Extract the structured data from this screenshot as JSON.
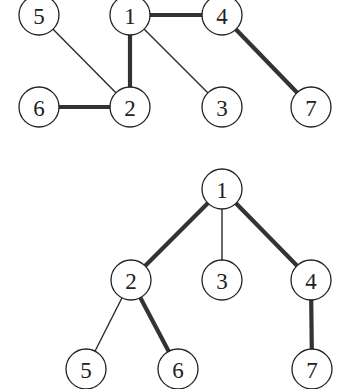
{
  "graphs": [
    {
      "name": "graph",
      "nodes": [
        {
          "id": "1",
          "label": "1",
          "x": 130,
          "y": 15
        },
        {
          "id": "4",
          "label": "4",
          "x": 222,
          "y": 15
        },
        {
          "id": "5",
          "label": "5",
          "x": 39,
          "y": 15
        },
        {
          "id": "6",
          "label": "6",
          "x": 39,
          "y": 107
        },
        {
          "id": "2",
          "label": "2",
          "x": 130,
          "y": 107
        },
        {
          "id": "3",
          "label": "3",
          "x": 222,
          "y": 107
        },
        {
          "id": "7",
          "label": "7",
          "x": 311,
          "y": 107
        }
      ],
      "edges": [
        {
          "from": "1",
          "to": "4",
          "weight": "thick"
        },
        {
          "from": "1",
          "to": "2",
          "weight": "thick"
        },
        {
          "from": "1",
          "to": "3",
          "weight": "thin"
        },
        {
          "from": "5",
          "to": "2",
          "weight": "thin"
        },
        {
          "from": "6",
          "to": "2",
          "weight": "thick"
        },
        {
          "from": "4",
          "to": "7",
          "weight": "thick"
        }
      ]
    },
    {
      "name": "spanning-tree",
      "nodes": [
        {
          "id": "1",
          "label": "1",
          "x": 222,
          "y": 189
        },
        {
          "id": "2",
          "label": "2",
          "x": 131,
          "y": 280
        },
        {
          "id": "3",
          "label": "3",
          "x": 222,
          "y": 280
        },
        {
          "id": "4",
          "label": "4",
          "x": 311,
          "y": 280
        },
        {
          "id": "5",
          "label": "5",
          "x": 86,
          "y": 369
        },
        {
          "id": "6",
          "label": "6",
          "x": 178,
          "y": 369
        },
        {
          "id": "7",
          "label": "7",
          "x": 312,
          "y": 369
        }
      ],
      "edges": [
        {
          "from": "1",
          "to": "2",
          "weight": "thick"
        },
        {
          "from": "1",
          "to": "3",
          "weight": "thin"
        },
        {
          "from": "1",
          "to": "4",
          "weight": "thick"
        },
        {
          "from": "2",
          "to": "5",
          "weight": "thin"
        },
        {
          "from": "2",
          "to": "6",
          "weight": "thick"
        },
        {
          "from": "4",
          "to": "7",
          "weight": "thick"
        }
      ]
    }
  ],
  "style": {
    "node_radius": 20,
    "stroke_color": "#222222",
    "background": "#ffffff"
  }
}
